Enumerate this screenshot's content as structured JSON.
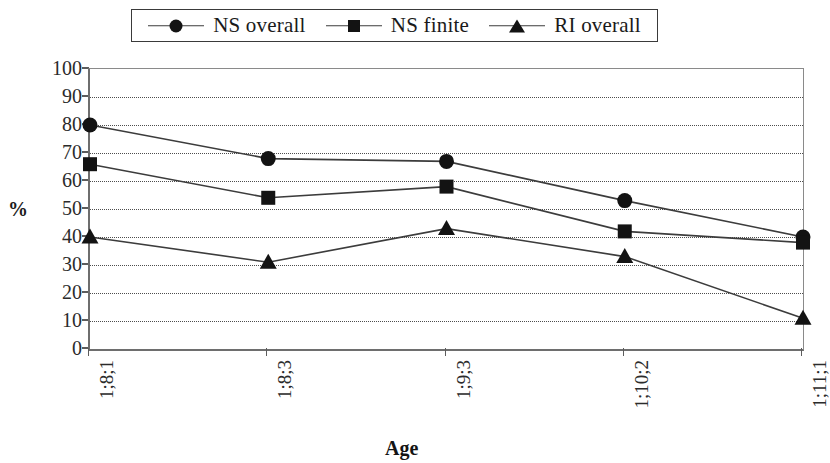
{
  "chart_data": {
    "type": "line",
    "title": "",
    "xlabel": "Age",
    "ylabel": "%",
    "categories": [
      "1;8;1",
      "1;8;3",
      "1;9;3",
      "1;10;2",
      "1;11;1"
    ],
    "ylim": [
      0,
      100
    ],
    "ytick_step": 10,
    "yticks": [
      "0",
      "10",
      "20",
      "30",
      "40",
      "50",
      "60",
      "70",
      "80",
      "90",
      "100"
    ],
    "grid": true,
    "legend_position": "top",
    "series": [
      {
        "name": "NS overall",
        "marker": "circle",
        "values": [
          80,
          68,
          67,
          53,
          40
        ]
      },
      {
        "name": "NS finite",
        "marker": "square",
        "values": [
          66,
          54,
          58,
          42,
          38
        ]
      },
      {
        "name": "RI overall",
        "marker": "triangle",
        "values": [
          40,
          31,
          43,
          33,
          11
        ]
      }
    ],
    "colors": {
      "line": "#3c3c3c",
      "marker": "#131313",
      "grid": "#4d4d4d",
      "axis": "#6e6e6e",
      "background": "#ffffff"
    }
  }
}
